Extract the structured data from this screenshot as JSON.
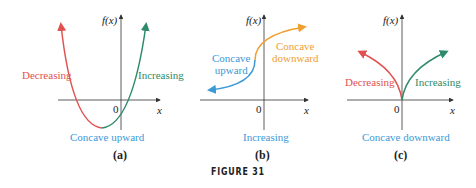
{
  "figure_label": "FIGURE 31",
  "colors": {
    "red": "#e0524f",
    "green": "#2e8b6a",
    "blue": "#3b9ad6",
    "orange": "#f0a030",
    "axis": "#333333"
  },
  "panels": [
    {
      "caption": "(a)",
      "y_label": "f(x)",
      "x_label": "x",
      "origin": "0",
      "left_label": "Decreasing",
      "right_label": "Increasing",
      "bottom_label": "Concave upward"
    },
    {
      "caption": "(b)",
      "y_label": "f(x)",
      "x_label": "x",
      "origin": "0",
      "left_label": "Concave upward",
      "left_label_l1": "Concave",
      "left_label_l2": "upward",
      "right_label_l1": "Concave",
      "right_label_l2": "downward",
      "bottom_label": "Increasing"
    },
    {
      "caption": "(c)",
      "y_label": "f(x)",
      "x_label": "x",
      "origin": "0",
      "left_label": "Decreasing",
      "right_label": "Increasing",
      "bottom_label": "Concave downward"
    }
  ]
}
